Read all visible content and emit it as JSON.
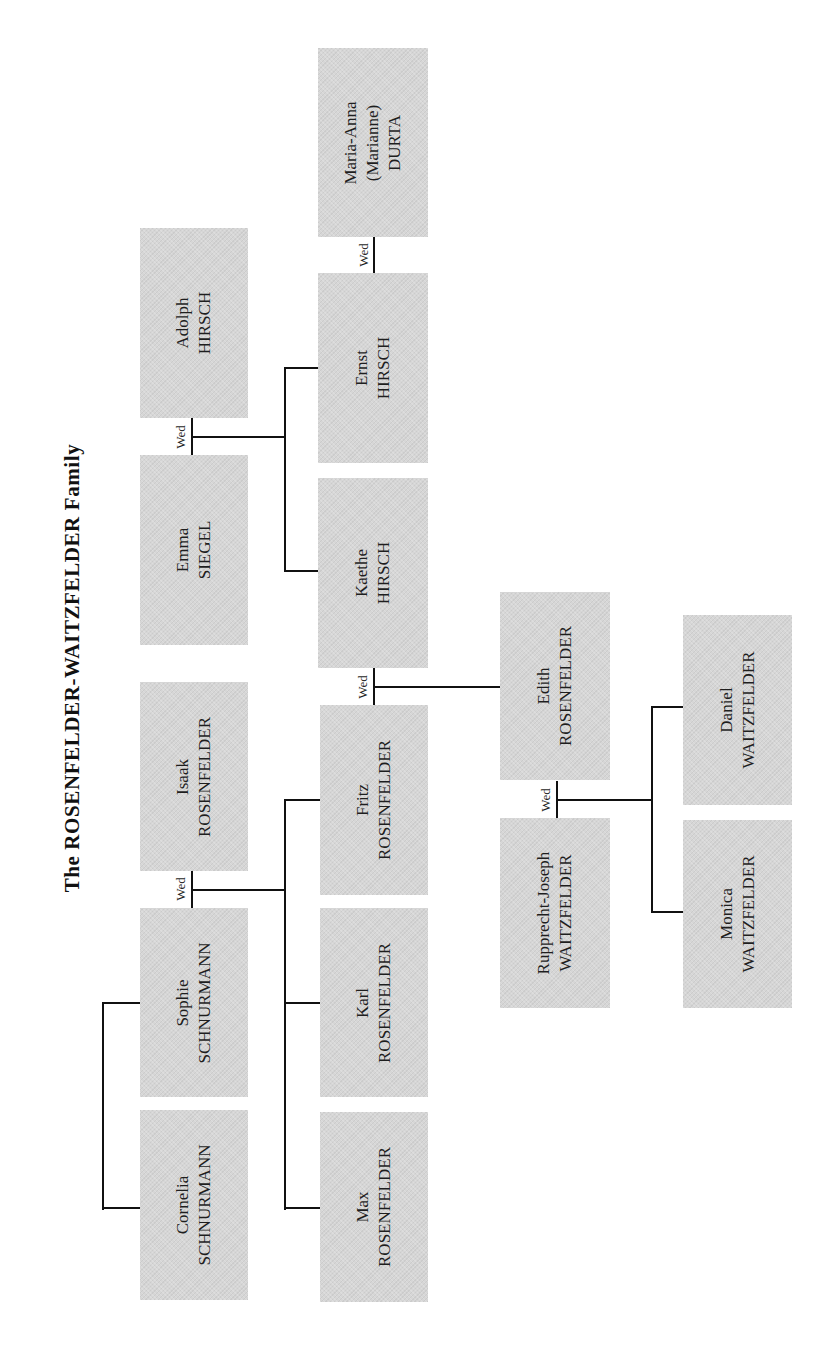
{
  "title": "The ROSENFELDER-WAITZFELDER Family",
  "marriage_label": "Wed",
  "colors": {
    "box_fill": "#d6d6d6",
    "line": "#111111",
    "background": "#ffffff"
  },
  "people": {
    "cornelia": {
      "first": "Cornelia",
      "last": "SCHNURMANN"
    },
    "sophie": {
      "first": "Sophie",
      "last": "SCHNURMANN"
    },
    "isaak": {
      "first": "Isaak",
      "last": "ROSENFELDER"
    },
    "emma": {
      "first": "Emma",
      "last": "SIEGEL"
    },
    "adolph": {
      "first": "Adolph",
      "last": "HIRSCH"
    },
    "max": {
      "first": "Max",
      "last": "ROSENFELDER"
    },
    "karl": {
      "first": "Karl",
      "last": "ROSENFELDER"
    },
    "fritz": {
      "first": "Fritz",
      "last": "ROSENFELDER"
    },
    "kaethe": {
      "first": "Kaethe",
      "last": "HIRSCH"
    },
    "ernst": {
      "first": "Ernst",
      "last": "HIRSCH"
    },
    "maria_anna": {
      "first": "Maria-Anna",
      "middle": "(Marianne)",
      "last": "DURTA"
    },
    "rupprecht": {
      "first": "Rupprecht-Joseph",
      "last": "WAITZFELDER"
    },
    "edith": {
      "first": "Edith",
      "last": "ROSENFELDER"
    },
    "monica": {
      "first": "Monica",
      "last": "WAITZFELDER"
    },
    "daniel": {
      "first": "Daniel",
      "last": "WAITZFELDER"
    }
  },
  "relationships": {
    "marriages": [
      [
        "sophie",
        "isaak"
      ],
      [
        "emma",
        "adolph"
      ],
      [
        "fritz",
        "kaethe"
      ],
      [
        "ernst",
        "maria_anna"
      ],
      [
        "rupprecht",
        "edith"
      ]
    ],
    "siblings": [
      [
        "cornelia",
        "sophie"
      ]
    ],
    "children": {
      "sophie+isaak": [
        "max",
        "karl",
        "fritz"
      ],
      "emma+adolph": [
        "kaethe",
        "ernst"
      ],
      "fritz+kaethe": [
        "edith"
      ],
      "rupprecht+edith": [
        "monica",
        "daniel"
      ]
    }
  }
}
